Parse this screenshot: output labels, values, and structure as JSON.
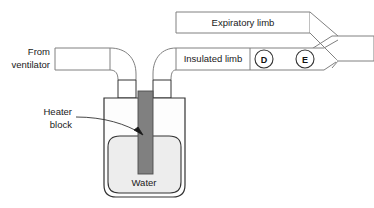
{
  "figure": {
    "background_color": "#ffffff",
    "line_color": "#808080",
    "dark_line_color": "#333333",
    "heater_block_color": "#808080",
    "water_color": "#ededed",
    "chamber_fill": "#fdfdfd"
  },
  "labels": {
    "from_ventilator_line1": "From",
    "from_ventilator_line2": "ventilator",
    "expiratory_limb": "Expiratory limb",
    "insulated_limb": "Insulated limb",
    "heater_block_line1": "Heater",
    "heater_block_line2": "block",
    "water": "Water"
  },
  "markers": [
    {
      "id": "marker-d",
      "letter": "D",
      "cx": 264,
      "cy": 59,
      "r": 9
    },
    {
      "id": "marker-e",
      "letter": "E",
      "cx": 305,
      "cy": 59,
      "r": 9
    }
  ],
  "components": {
    "inspiratory_tube": "inspiratory-tube-from-ventilator",
    "humidifier_chamber": "humidifier-water-chamber",
    "heater_block": "heater-block",
    "insulated_limb_tube": "insulated-limb-tube",
    "expiratory_limb_tube": "expiratory-limb-tube",
    "y_piece": "y-piece-connector",
    "leader_line": "heater-block-leader-line"
  }
}
